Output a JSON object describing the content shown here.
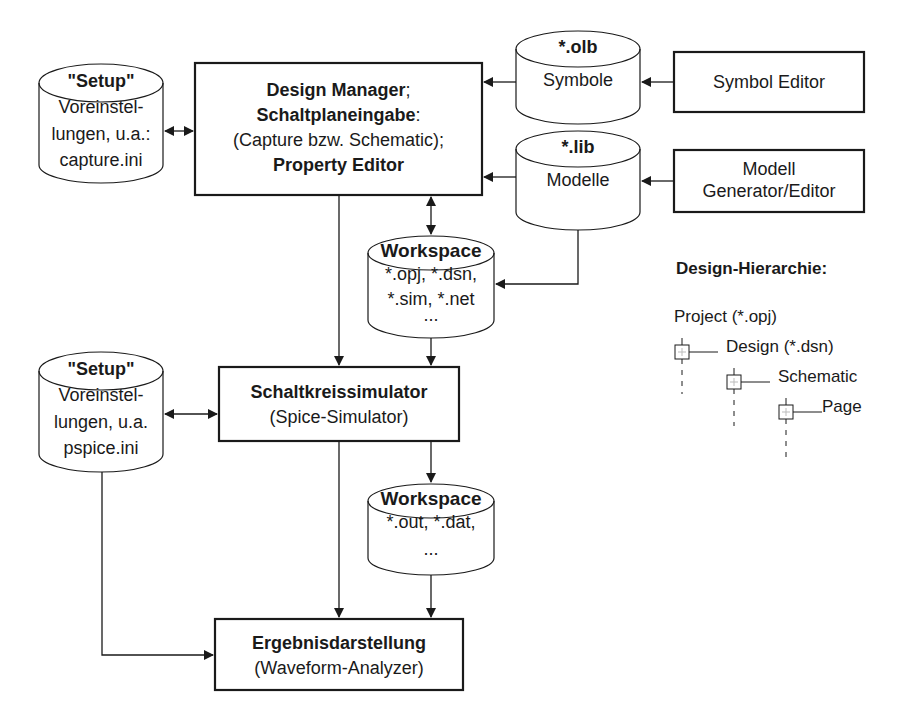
{
  "colors": {
    "stroke": "#1a1a1a",
    "background": "#ffffff"
  },
  "setup_capture": {
    "title": "\"Setup\"",
    "lines": [
      "Voreinstel-",
      "lungen, u.a.:",
      "capture.ini"
    ]
  },
  "design_manager": {
    "line1_bold": "Design Manager",
    "line1_suffix": ";",
    "line2_bold": "Schaltplaneingabe",
    "line2_suffix": ":",
    "line3": "(Capture bzw. Schematic);",
    "line4_bold": "Property Editor"
  },
  "olb_store": {
    "title": "*.olb",
    "label": "Symbole"
  },
  "lib_store": {
    "title": "*.lib",
    "label": "Modelle"
  },
  "symbol_editor": {
    "label": "Symbol Editor"
  },
  "model_editor": {
    "lines": [
      "Modell",
      "Generator/Editor"
    ]
  },
  "workspace_design": {
    "title": "Workspace",
    "lines": [
      "*.opj, *.dsn,",
      "*.sim,  *.net",
      "..."
    ]
  },
  "setup_pspice": {
    "title": "\"Setup\"",
    "lines": [
      "Voreinstel-",
      "lungen, u.a.",
      "pspice.ini"
    ]
  },
  "simulator": {
    "title": "Schaltkreissimulator",
    "subtitle": "(Spice-Simulator)"
  },
  "workspace_sim": {
    "title": "Workspace",
    "lines": [
      "*.out, *.dat,",
      "..."
    ]
  },
  "results": {
    "title": "Ergebnisdarstellung",
    "subtitle": "(Waveform-Analyzer)"
  },
  "hierarchy": {
    "heading": "Design-Hierarchie:",
    "levels": [
      "Project (*.opj)",
      "Design (*.dsn)",
      "Schematic",
      "Page"
    ]
  }
}
